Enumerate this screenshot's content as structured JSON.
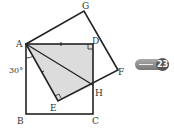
{
  "diagram": {
    "points": {
      "A": "A",
      "B": "B",
      "C": "C",
      "D": "D",
      "E": "E",
      "F": "F",
      "G": "G",
      "H": "H"
    },
    "angle_label": "30°",
    "colors": {
      "line": "#222222",
      "shade": "#dcdcdc"
    }
  },
  "badge": {
    "icon": "arrow-right-icon",
    "number": "23"
  }
}
